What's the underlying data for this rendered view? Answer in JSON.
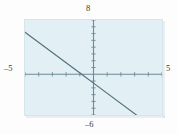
{
  "figure": {
    "kind": "graphing-calculator-window",
    "top_label": "8",
    "bottom_label": "–6",
    "left_label": "–5",
    "right_label": "5",
    "background_color": "#e2eff4",
    "page_color": "#fdfdfd",
    "axis_color": "#6d8a96",
    "curve_color": "#55707e"
  },
  "chart_data": {
    "type": "line",
    "title": "",
    "xlabel": "",
    "ylabel": "",
    "xlim": [
      -5,
      5
    ],
    "ylim": [
      -6,
      8
    ],
    "xtick_labels": [
      "-5",
      "5"
    ],
    "ytick_labels": [
      "8",
      "-6"
    ],
    "grid": false,
    "legend": null,
    "axes": {
      "x_axis_at_y": 0,
      "y_axis_at_x": 0,
      "tick_spacing_x": 1,
      "tick_spacing_y": 1
    },
    "series": [
      {
        "name": "line",
        "slope": -1.5,
        "intercept": -1.3,
        "x": [
          -5,
          -0.867,
          0,
          3.533
        ],
        "y": [
          6.2,
          0,
          -1.3,
          -6.6
        ],
        "points_visible": [
          {
            "x": -5,
            "y": 6.2
          },
          {
            "x": -4,
            "y": 4.7
          },
          {
            "x": -3,
            "y": 3.2
          },
          {
            "x": -2,
            "y": 1.7
          },
          {
            "x": -0.867,
            "y": 0
          },
          {
            "x": 0,
            "y": -1.3
          },
          {
            "x": 1,
            "y": -2.8
          },
          {
            "x": 2,
            "y": -4.3
          },
          {
            "x": 3,
            "y": -5.8
          }
        ]
      }
    ]
  }
}
